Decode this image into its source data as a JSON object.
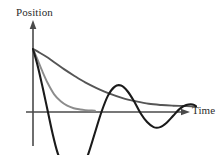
{
  "chart_data": {
    "type": "line",
    "title": "",
    "subtitle": "",
    "xlabel": "Time",
    "ylabel": "Position",
    "grid": false,
    "legend_position": "none",
    "axis_style": "arrows",
    "xlim": [
      0,
      10
    ],
    "ylim": [
      -1.35,
      1.35
    ],
    "annotations": [],
    "tick_labels": {
      "x": [],
      "y": []
    },
    "series": [
      {
        "name": "overdamped",
        "color": "#555555",
        "width": 1.9,
        "description": "Slow monotonic decay toward zero, no oscillation",
        "x": [
          0.0,
          0.35,
          0.8,
          1.3,
          1.9,
          2.5,
          3.2,
          3.9,
          4.7,
          5.5,
          6.3,
          7.1,
          7.9,
          8.6,
          9.2,
          9.7,
          10.0
        ],
        "y": [
          1.0,
          0.95,
          0.88,
          0.79,
          0.68,
          0.58,
          0.47,
          0.38,
          0.29,
          0.22,
          0.17,
          0.13,
          0.11,
          0.1,
          0.095,
          0.09,
          0.09
        ]
      },
      {
        "name": "critically-damped",
        "color": "#8c8c8c",
        "width": 1.9,
        "description": "Fast monotonic return to zero without overshoot, curve drawn only to mid-range",
        "x": [
          0.0,
          0.25,
          0.55,
          0.9,
          1.3,
          1.7,
          2.1,
          2.5,
          2.9,
          3.2,
          3.5,
          3.8
        ],
        "y": [
          1.0,
          0.85,
          0.66,
          0.46,
          0.28,
          0.17,
          0.1,
          0.06,
          0.04,
          0.03,
          0.025,
          0.02
        ]
      },
      {
        "name": "underdamped",
        "color": "#1a1a1a",
        "width": 2.1,
        "description": "Oscillatory decay crossing the axis several times with shrinking amplitude",
        "x": [
          0.0,
          0.3,
          0.6,
          0.9,
          1.2,
          1.5,
          1.9,
          2.2,
          2.6,
          3.0,
          3.4,
          3.8,
          4.2,
          4.6,
          5.0,
          5.4,
          5.8,
          6.2,
          6.6,
          7.0,
          7.4,
          7.8,
          8.2,
          8.6,
          9.0,
          9.4,
          9.8,
          10.0
        ],
        "y": [
          1.0,
          0.72,
          0.38,
          0.02,
          -0.34,
          -0.64,
          -0.9,
          -1.03,
          -1.05,
          -0.92,
          -0.66,
          -0.33,
          0.0,
          0.26,
          0.4,
          0.42,
          0.33,
          0.17,
          -0.02,
          -0.16,
          -0.24,
          -0.24,
          -0.17,
          -0.06,
          0.05,
          0.11,
          0.12,
          0.09
        ]
      }
    ]
  },
  "labels": {
    "y_axis": "Position",
    "x_axis": "Time"
  },
  "colors": {
    "axis": "#4a4a4a",
    "background": "#ffffff",
    "underdamped": "#1a1a1a",
    "critically_damped": "#8c8c8c",
    "overdamped": "#555555"
  }
}
